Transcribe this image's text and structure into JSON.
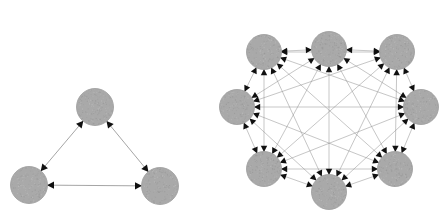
{
  "figure": {
    "background_color": "#ffffff",
    "width": 446,
    "height": 215,
    "node_fill_color": "#a9a9a9",
    "node_edge_color": "#9a9a9a",
    "edge_color": "#8f8f8f",
    "arrowhead_color": "#101010"
  },
  "panels": [
    {
      "id": "left-panel",
      "name": "triangle-graph",
      "label": "",
      "graph_type": "complete directed graph K3",
      "node_count": 3,
      "edge_count": 6,
      "node_radius": 18.5,
      "nodes": [
        {
          "id": "n0",
          "label": "",
          "cx": 95,
          "cy": 107
        },
        {
          "id": "n1",
          "label": "",
          "cx": 29,
          "cy": 185
        },
        {
          "id": "n2",
          "label": "",
          "cx": 160,
          "cy": 186
        }
      ],
      "edges": [
        {
          "from": "n0",
          "to": "n1",
          "directed": true
        },
        {
          "from": "n1",
          "to": "n0",
          "directed": true
        },
        {
          "from": "n0",
          "to": "n2",
          "directed": true
        },
        {
          "from": "n2",
          "to": "n0",
          "directed": true
        },
        {
          "from": "n1",
          "to": "n2",
          "directed": true
        },
        {
          "from": "n2",
          "to": "n1",
          "directed": true
        }
      ]
    },
    {
      "id": "right-panel",
      "name": "octagon-graph",
      "label": "",
      "graph_type": "complete directed graph K8",
      "node_count": 8,
      "edge_count": 56,
      "node_radius": 17.5,
      "ring_center_x": 329,
      "ring_center_y": 120,
      "ring_radius": 71,
      "nodes": [
        {
          "id": "m0",
          "label": "",
          "cx": 329,
          "cy": 49
        },
        {
          "id": "m1",
          "label": "",
          "cx": 397,
          "cy": 52
        },
        {
          "id": "m2",
          "label": "",
          "cx": 421,
          "cy": 107
        },
        {
          "id": "m3",
          "label": "",
          "cx": 395,
          "cy": 169
        },
        {
          "id": "m4",
          "label": "",
          "cx": 329,
          "cy": 192
        },
        {
          "id": "m5",
          "label": "",
          "cx": 264,
          "cy": 169
        },
        {
          "id": "m6",
          "label": "",
          "cx": 237,
          "cy": 107
        },
        {
          "id": "m7",
          "label": "",
          "cx": 264,
          "cy": 52
        }
      ],
      "edges_all_pairs": true,
      "edges_directed": true
    }
  ]
}
